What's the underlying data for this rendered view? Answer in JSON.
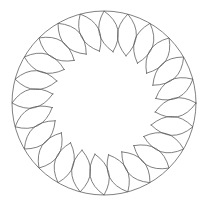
{
  "figure": {
    "background": "#ffffff",
    "stroke_color": "#555555",
    "stroke_width": 0.75,
    "center": [
      104,
      103
    ],
    "outer_circle": {
      "radius": 92
    },
    "petals": {
      "count": 24,
      "inner_radius": 52,
      "outer_radius": 92,
      "half_width": 9.5,
      "tilt_degrees": 10,
      "start_angle_degrees": 0
    }
  }
}
